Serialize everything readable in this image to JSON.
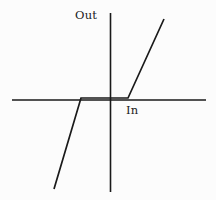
{
  "figure": {
    "title": "",
    "background_color": "#fcfcfc",
    "line_color": "#1a1a1a"
  },
  "labels": {
    "y_axis": "Out",
    "x_axis": "In"
  },
  "chart_data": {
    "type": "line",
    "title": "",
    "xlabel": "In",
    "ylabel": "Out",
    "grid": false,
    "legend": null,
    "axes": {
      "x_axis_pixels": {
        "x1": 12,
        "x2": 206,
        "y": 100
      },
      "y_axis_pixels": {
        "y1": 13,
        "y2": 192,
        "x": 110
      },
      "origin_pixels": {
        "x": 110,
        "y": 100
      },
      "xlim": [
        -1.0,
        1.0
      ],
      "ylim": [
        -1.0,
        1.0
      ]
    },
    "series": [
      {
        "name": "transfer-characteristic",
        "points_pixels": [
          {
            "x": 54,
            "y": 189
          },
          {
            "x": 81,
            "y": 98
          },
          {
            "x": 128,
            "y": 98
          },
          {
            "x": 164,
            "y": 19
          }
        ],
        "points_data": [
          {
            "x": -0.62,
            "y": -0.92
          },
          {
            "x": -0.31,
            "y": 0.0
          },
          {
            "x": 0.2,
            "y": 0.0
          },
          {
            "x": 0.58,
            "y": 0.81
          }
        ],
        "breakpoints": {
          "lower": -0.31,
          "upper": 0.2
        }
      }
    ]
  }
}
